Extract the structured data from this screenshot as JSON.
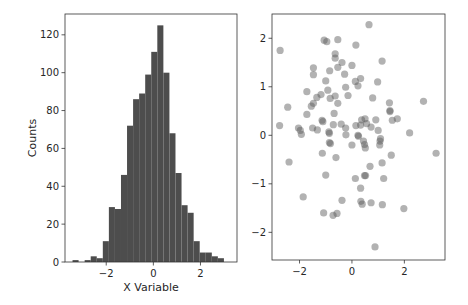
{
  "figure": {
    "width": 468,
    "height": 305,
    "background": "#ffffff"
  },
  "colors": {
    "bar_fill": "#4d4d4d",
    "point_fill": "#555555",
    "point_opacity": 0.45,
    "axis": "#333333",
    "text": "#262626"
  },
  "chart_data": [
    {
      "type": "bar",
      "subtype": "histogram",
      "title": "",
      "xlabel": "X Variable",
      "ylabel": "Counts",
      "xlim": [
        -3.75,
        3.55
      ],
      "ylim": [
        0,
        131
      ],
      "xticks": [
        -2,
        0,
        2
      ],
      "xtick_labels": [
        "−2",
        "0",
        "2"
      ],
      "yticks": [
        0,
        20,
        40,
        60,
        80,
        100,
        120
      ],
      "ytick_labels": [
        "0",
        "20",
        "40",
        "60",
        "80",
        "100",
        "120"
      ],
      "grid": false,
      "legend": null,
      "bin_start": -3.43,
      "bin_width": 0.257,
      "bin_edges": [
        -3.43,
        -3.173,
        -2.916,
        -2.659,
        -2.402,
        -2.145,
        -1.888,
        -1.631,
        -1.374,
        -1.117,
        -0.86,
        -0.603,
        -0.346,
        -0.089,
        0.168,
        0.425,
        0.682,
        0.939,
        1.196,
        1.453,
        1.71,
        1.967,
        2.224,
        2.481,
        2.738,
        2.995
      ],
      "values": [
        1,
        0,
        1,
        3,
        2,
        11,
        29,
        28,
        46,
        72,
        86,
        89,
        99,
        111,
        125,
        100,
        68,
        47,
        30,
        26,
        11,
        5,
        5,
        3,
        2
      ]
    },
    {
      "type": "scatter",
      "title": "",
      "xlabel": "",
      "ylabel": "",
      "xlim": [
        -3.05,
        3.55
      ],
      "ylim": [
        -2.57,
        2.5
      ],
      "xticks": [
        -2,
        0,
        2
      ],
      "xtick_labels": [
        "−2",
        "0",
        "2"
      ],
      "yticks": [
        -2,
        -1,
        0,
        1,
        2
      ],
      "ytick_labels": [
        "−2",
        "−1",
        "0",
        "1",
        "2"
      ],
      "grid": false,
      "legend": null,
      "x": [
        0.65,
        -2.74,
        -1.06,
        -0.96,
        -0.54,
        0.15,
        -0.64,
        -0.64,
        -0.38,
        -0.54,
        0.0,
        1.15,
        -1.47,
        -1.47,
        -0.85,
        -0.28,
        0.33,
        -1.0,
        0.13,
        0.23,
        0.98,
        -0.24,
        -1.72,
        -0.92,
        0.79,
        -0.15,
        -1.18,
        -1.34,
        -0.83,
        -0.64,
        2.73,
        1.43,
        -1.47,
        -1.55,
        -0.54,
        -2.45,
        1.45,
        1.45,
        -1.72,
        -0.68,
        -1.14,
        -1.11,
        0.91,
        1.54,
        1.73,
        0.37,
        0.5,
        0.56,
        -0.71,
        -0.41,
        0.15,
        0.33,
        0.73,
        -2.76,
        -1.5,
        -1.32,
        -2.04,
        -1.97,
        1.0,
        -0.24,
        -0.88,
        -0.86,
        -1.93,
        -0.23,
        0.23,
        0.25,
        2.2,
        1.09,
        1.07,
        0.44,
        0.48,
        0.51,
        -0.86,
        -0.82,
        0.0,
        1.06,
        -1.13,
        -0.61,
        1.5,
        3.21,
        -2.4,
        1.15,
        0.69,
        -1.0,
        0.48,
        0.52,
        0.13,
        1.21,
        0.33,
        -1.86,
        -0.38,
        0.34,
        0.39,
        0.73,
        1.16,
        1.98,
        -1.08,
        -0.57,
        -0.72,
        0.88
      ],
      "y": [
        2.28,
        1.75,
        1.96,
        1.93,
        1.97,
        1.86,
        1.68,
        1.59,
        1.5,
        1.4,
        1.44,
        1.53,
        1.39,
        1.25,
        1.33,
        1.26,
        1.17,
        1.12,
        1.11,
        1.02,
        1.1,
        0.99,
        0.9,
        0.93,
        0.77,
        0.82,
        0.84,
        0.78,
        0.76,
        0.81,
        0.7,
        0.67,
        0.66,
        0.6,
        0.66,
        0.58,
        0.51,
        0.49,
        0.43,
        0.45,
        0.31,
        0.28,
        0.32,
        0.31,
        0.34,
        0.32,
        0.34,
        0.24,
        0.22,
        0.23,
        0.2,
        0.21,
        0.17,
        0.2,
        0.15,
        0.11,
        0.15,
        0.1,
        0.1,
        0.15,
        0.07,
        0.04,
        0.02,
        0.01,
        0.0,
        -0.02,
        0.05,
        -0.07,
        -0.12,
        -0.12,
        -0.19,
        -0.26,
        -0.15,
        -0.17,
        -0.2,
        -0.2,
        -0.37,
        -0.46,
        -0.41,
        -0.37,
        -0.55,
        -0.57,
        -0.64,
        -0.82,
        -0.83,
        -0.83,
        -0.89,
        -0.89,
        -1.09,
        -1.27,
        -1.34,
        -1.36,
        -1.42,
        -1.39,
        -1.43,
        -1.51,
        -1.6,
        -1.61,
        -1.65,
        -2.3
      ]
    }
  ]
}
